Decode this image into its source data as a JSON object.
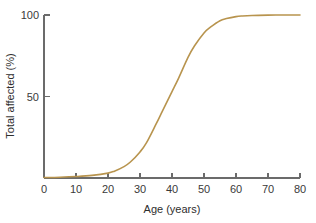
{
  "chart_data": {
    "type": "line",
    "title": "",
    "subtitle": "",
    "xlabel": "Age (years)",
    "ylabel": "Total affected (%)",
    "xlim": [
      0,
      80
    ],
    "ylim": [
      0,
      100
    ],
    "xticks": [
      0,
      10,
      20,
      30,
      40,
      50,
      60,
      70,
      80
    ],
    "xticklabels": [
      "0",
      "10",
      "20",
      "30",
      "40",
      "50",
      "60",
      "70",
      "80"
    ],
    "yticks": [
      50,
      100
    ],
    "yticklabels": [
      "50",
      "100"
    ],
    "grid": false,
    "legend": false,
    "legend_position": "none",
    "annotations": [],
    "series": [
      {
        "name": "Cumulative proportion affected",
        "color": "#b8944e",
        "x": [
          0,
          5,
          10,
          15,
          20,
          22,
          25,
          27,
          30,
          32,
          35,
          37,
          40,
          42,
          45,
          47,
          50,
          52,
          55,
          57,
          60,
          62,
          65,
          70,
          75,
          80
        ],
        "values": [
          0.3,
          0.5,
          0.9,
          1.6,
          3.0,
          4.2,
          7.0,
          9.8,
          16.0,
          21.5,
          33.0,
          41.0,
          53.0,
          61.0,
          74.0,
          81.0,
          89.0,
          92.5,
          96.5,
          97.8,
          99.0,
          99.4,
          99.7,
          99.9,
          100.0,
          100.0
        ]
      }
    ]
  },
  "figure": {
    "background_color": "#ffffff",
    "axis_color": "#6b6b6b",
    "text_color": "#2e2e2e",
    "curve_color": "#b8944e"
  }
}
